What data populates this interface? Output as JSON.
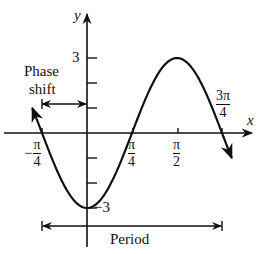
{
  "axes": {
    "x_label": "x",
    "y_label": "y"
  },
  "labels": {
    "phase_shift_line1": "Phase",
    "phase_shift_line2": "shift",
    "period": "Period",
    "y_max": "3",
    "y_min": "−3",
    "x_neg_pi_4": {
      "sign": "−",
      "num": "π",
      "den": "4"
    },
    "x_pi_4": {
      "num": "π",
      "den": "4"
    },
    "x_pi_2": {
      "num": "π",
      "den": "2"
    },
    "x_3pi_4": {
      "num": "3π",
      "den": "4"
    }
  },
  "chart_data": {
    "type": "line",
    "title": "",
    "function": "y = -3 cos(2x)",
    "xlabel": "x",
    "ylabel": "y",
    "x_ticks": [
      "−π/4",
      "π/4",
      "π/2",
      "3π/4"
    ],
    "y_ticks": [
      3,
      2,
      1,
      -1,
      -2,
      -3
    ],
    "y_tick_labels": [
      "3",
      "−3"
    ],
    "key_points": [
      {
        "x": "−π/4",
        "y": 0
      },
      {
        "x": "0",
        "y": -3
      },
      {
        "x": "π/4",
        "y": 0
      },
      {
        "x": "π/2",
        "y": 3
      },
      {
        "x": "3π/4",
        "y": 0
      }
    ],
    "annotations": [
      {
        "text": "Phase shift",
        "from": "−π/4",
        "to": "0"
      },
      {
        "text": "Period",
        "from": "−π/4",
        "to": "3π/4"
      }
    ],
    "grid": false
  }
}
